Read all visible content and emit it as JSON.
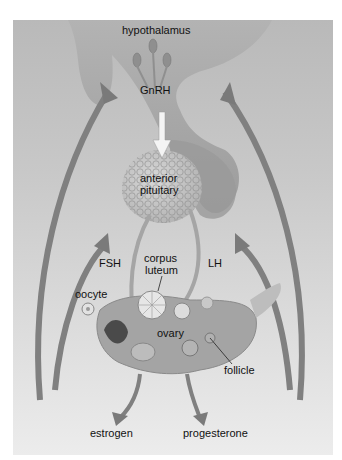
{
  "diagram": {
    "type": "hormonal-feedback-pathway",
    "nodes": [
      {
        "id": "hypothalamus",
        "label": "hypothalamus"
      },
      {
        "id": "gnrh",
        "label": "GnRH"
      },
      {
        "id": "anterior_pituitary",
        "label": "anterior\npituitary"
      },
      {
        "id": "fsh",
        "label": "FSH"
      },
      {
        "id": "lh",
        "label": "LH"
      },
      {
        "id": "corpus_luteum",
        "label": "corpus\nluteum"
      },
      {
        "id": "oocyte",
        "label": "oocyte"
      },
      {
        "id": "ovary",
        "label": "ovary"
      },
      {
        "id": "follicle",
        "label": "follicle"
      },
      {
        "id": "estrogen",
        "label": "estrogen"
      },
      {
        "id": "progesterone",
        "label": "progesterone"
      }
    ],
    "edges": [
      {
        "from": "hypothalamus",
        "to": "anterior_pituitary",
        "label": "GnRH"
      },
      {
        "from": "anterior_pituitary",
        "to": "ovary",
        "label": "FSH"
      },
      {
        "from": "anterior_pituitary",
        "to": "corpus_luteum",
        "label": "LH"
      },
      {
        "from": "ovary",
        "to": "estrogen"
      },
      {
        "from": "ovary",
        "to": "progesterone"
      },
      {
        "from": "estrogen",
        "to": "hypothalamus",
        "label": "feedback"
      },
      {
        "from": "estrogen",
        "to": "anterior_pituitary",
        "label": "feedback"
      },
      {
        "from": "progesterone",
        "to": "hypothalamus",
        "label": "feedback"
      },
      {
        "from": "progesterone",
        "to": "anterior_pituitary",
        "label": "feedback"
      }
    ]
  },
  "labels": {
    "hypothalamus": "hypothalamus",
    "gnrh": "GnRH",
    "anterior_line1": "anterior",
    "anterior_line2": "pituitary",
    "fsh": "FSH",
    "lh": "LH",
    "corpus_line1": "corpus",
    "corpus_line2": "luteum",
    "oocyte": "oocyte",
    "ovary": "ovary",
    "follicle": "follicle",
    "estrogen": "estrogen",
    "progesterone": "progesterone"
  },
  "colors": {
    "tissue": "#a8a8a8",
    "arrow": "#7f7f7f",
    "arrow_dark": "#5a5a5a",
    "text": "#111111"
  }
}
